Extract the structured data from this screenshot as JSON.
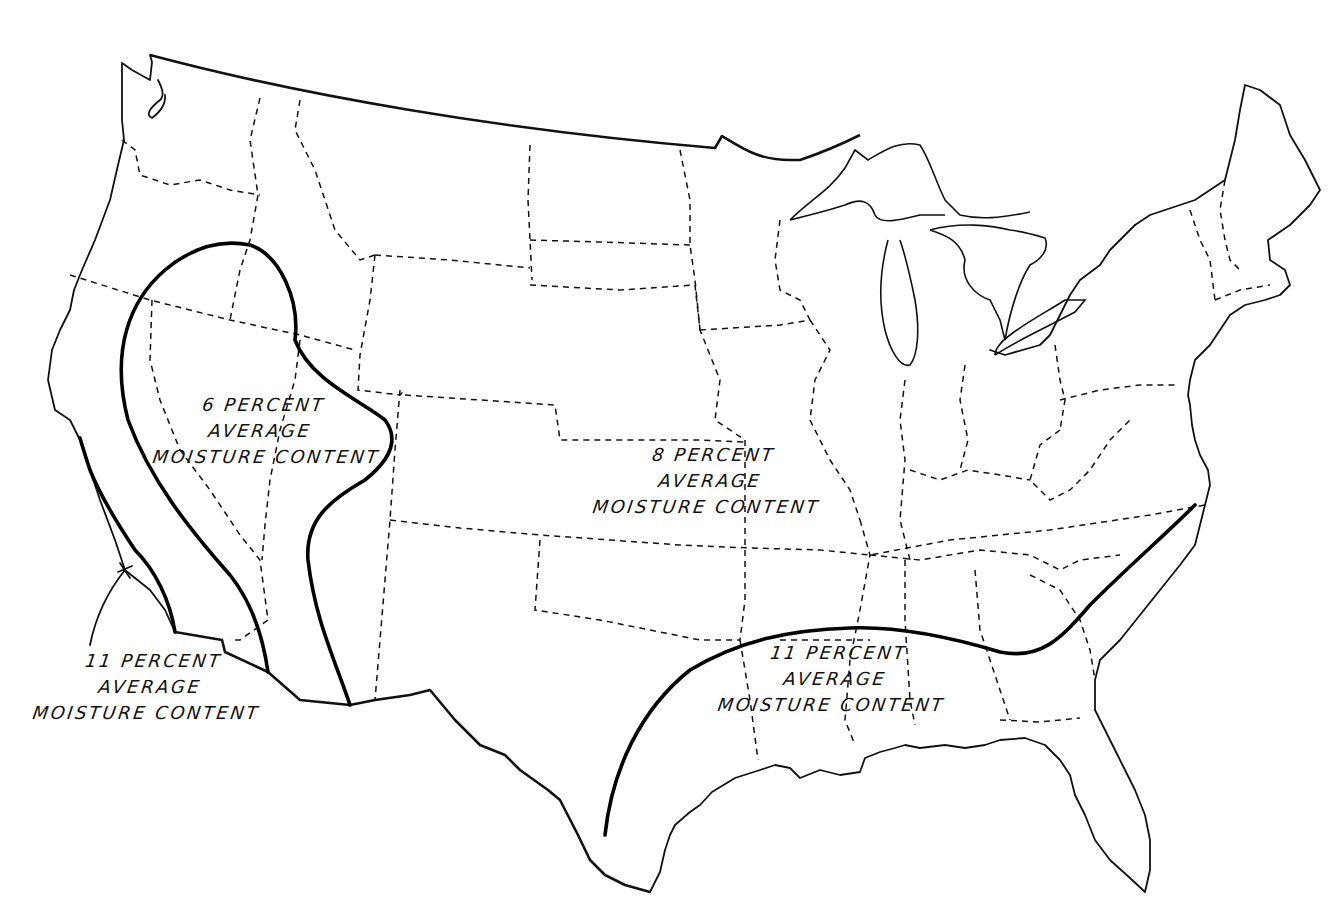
{
  "map": {
    "type": "zone-map",
    "subject": "Average moisture content zones, conterminous United States",
    "zones": [
      {
        "id": "zone-6",
        "lines": [
          "6 PERCENT",
          "AVERAGE",
          "MOISTURE CONTENT"
        ],
        "value_percent": 6,
        "region": "Southwest interior (Nevada, Utah, Arizona, SE California)"
      },
      {
        "id": "zone-8",
        "lines": [
          "8 PERCENT",
          "AVERAGE",
          "MOISTURE CONTENT"
        ],
        "value_percent": 8,
        "region": "Most of the United States"
      },
      {
        "id": "zone-11-southeast",
        "lines": [
          "11 PERCENT",
          "AVERAGE",
          "MOISTURE CONTENT"
        ],
        "value_percent": 11,
        "region": "Gulf and South Atlantic coast"
      },
      {
        "id": "zone-11-pacific",
        "lines": [
          "11 PERCENT",
          "AVERAGE",
          "MOISTURE CONTENT"
        ],
        "value_percent": 11,
        "region": "Southern California coast"
      }
    ],
    "legend": {
      "solid_heavy_line": "zone boundary",
      "dashed_line": "state boundary",
      "solid_thin_line": "coastline / national border"
    },
    "colors": {
      "ink": "#111111",
      "background": "#ffffff"
    }
  }
}
